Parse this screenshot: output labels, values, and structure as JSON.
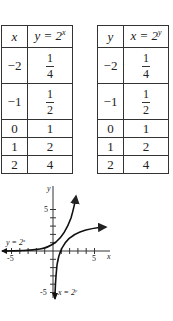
{
  "tables": [
    {
      "headers": {
        "col1": "x",
        "col2_lhs": "y = 2",
        "col2_exp": "x"
      },
      "rows": [
        {
          "c1": "−2",
          "num": "1",
          "den": "4"
        },
        {
          "c1": "−1",
          "num": "1",
          "den": "2"
        },
        {
          "c1": "0",
          "val": "1"
        },
        {
          "c1": "1",
          "val": "2"
        },
        {
          "c1": "2",
          "val": "4"
        }
      ]
    },
    {
      "headers": {
        "col1": "y",
        "col2_lhs": "x = 2",
        "col2_exp": "y"
      },
      "rows": [
        {
          "c1": "−2",
          "num": "1",
          "den": "4"
        },
        {
          "c1": "−1",
          "num": "1",
          "den": "2"
        },
        {
          "c1": "0",
          "val": "1"
        },
        {
          "c1": "1",
          "val": "2"
        },
        {
          "c1": "2",
          "val": "4"
        }
      ]
    }
  ],
  "graph": {
    "x_axis_label": "x",
    "y_axis_label": "y",
    "x_tick_labels": [
      "-5",
      "5"
    ],
    "y_tick_labels": [
      "5",
      "-5"
    ],
    "curve1_label_lhs": "y = 2",
    "curve1_label_exp": "x",
    "curve2_label_lhs": "x = 2",
    "curve2_label_exp": "y"
  }
}
